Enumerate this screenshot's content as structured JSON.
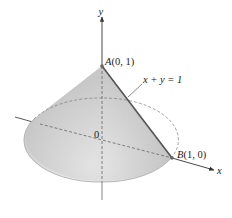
{
  "figure": {
    "axes": {
      "y_label": "y",
      "x_label": "x",
      "origin_label": "0"
    },
    "points": [
      {
        "id": "A",
        "name": "A",
        "coords": "(0, 1)"
      },
      {
        "id": "B",
        "name": "B",
        "coords": "(1, 0)"
      }
    ],
    "line_label": "x + y = 1",
    "colors": {
      "cone_fill_light": "#ececec",
      "cone_fill_dark": "#b9b9b9",
      "axis": "#444444",
      "generator_line": "#555555",
      "dashed": "#6e6e6e"
    }
  }
}
